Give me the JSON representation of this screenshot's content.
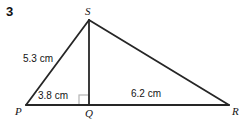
{
  "question": {
    "number": "3"
  },
  "figure": {
    "type": "triangle-with-altitude",
    "stroke_color": "#262626",
    "right_angle_color": "#b4b4b4",
    "background_color": "#ffffff",
    "vertices": [
      {
        "name": "S",
        "label": "S",
        "x": 89,
        "y": 20
      },
      {
        "name": "P",
        "label": "P",
        "x": 26,
        "y": 105
      },
      {
        "name": "Q",
        "label": "Q",
        "x": 89,
        "y": 105
      },
      {
        "name": "R",
        "label": "R",
        "x": 229,
        "y": 105
      }
    ],
    "segments": [
      {
        "name": "side-PS",
        "from": "P",
        "to": "S"
      },
      {
        "name": "side-SR",
        "from": "S",
        "to": "R"
      },
      {
        "name": "base-PR",
        "from": "P",
        "to": "R"
      },
      {
        "name": "altitude-SQ",
        "from": "S",
        "to": "Q"
      }
    ],
    "measurements": [
      {
        "name": "PS",
        "value": "5.3",
        "unit": "cm",
        "text": "5.3 cm"
      },
      {
        "name": "PQ",
        "value": "3.8",
        "unit": "cm",
        "text": "3.8 cm"
      },
      {
        "name": "QR",
        "value": "6.2",
        "unit": "cm",
        "text": "6.2 cm"
      }
    ],
    "right_angle": {
      "at": "Q",
      "size": 10,
      "x": 79,
      "y": 95
    }
  }
}
